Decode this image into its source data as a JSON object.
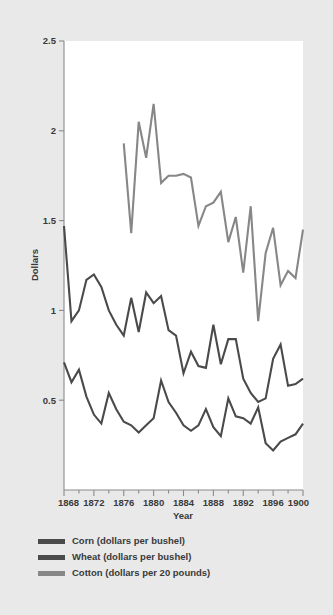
{
  "chart_data": {
    "type": "line",
    "title": "",
    "xlabel": "Year",
    "ylabel": "Dollars",
    "xlim": [
      1868,
      1900
    ],
    "ylim": [
      0,
      2.5
    ],
    "grid": false,
    "legend_position": "bottom-left",
    "x_tick_labels": [
      "1868",
      "1872",
      "1876",
      "1880",
      "1884",
      "1888",
      "1892",
      "1896",
      "1900"
    ],
    "x_tick_values": [
      1868,
      1872,
      1876,
      1880,
      1884,
      1888,
      1892,
      1896,
      1900
    ],
    "x_minor_ticks": [
      1870,
      1874,
      1878,
      1882,
      1886,
      1890,
      1894,
      1898
    ],
    "y_tick_labels": [
      "0.5",
      "1",
      "1.5",
      "2",
      "2.5"
    ],
    "y_tick_values": [
      0.5,
      1,
      1.5,
      2,
      2.5
    ],
    "colors": {
      "corn": "#4a4a4a",
      "wheat": "#4a4a4a",
      "cotton": "#878787",
      "axis": "#8a8a8a",
      "text": "#3a3a3a",
      "page_background": "#e9e9e9",
      "plot_background": "#ffffff"
    },
    "series": [
      {
        "name": "Corn (dollars per bushel)",
        "color": "#4a4a4a",
        "x": [
          1868,
          1869,
          1870,
          1871,
          1872,
          1873,
          1874,
          1875,
          1876,
          1877,
          1878,
          1879,
          1880,
          1881,
          1882,
          1883,
          1884,
          1885,
          1886,
          1887,
          1888,
          1889,
          1890,
          1891,
          1892,
          1893,
          1894,
          1895,
          1896,
          1897,
          1898,
          1899,
          1900
        ],
        "values": [
          0.71,
          0.6,
          0.67,
          0.52,
          0.42,
          0.37,
          0.54,
          0.45,
          0.38,
          0.36,
          0.32,
          0.36,
          0.4,
          0.61,
          0.49,
          0.43,
          0.36,
          0.33,
          0.36,
          0.45,
          0.35,
          0.3,
          0.51,
          0.41,
          0.4,
          0.37,
          0.46,
          0.26,
          0.22,
          0.27,
          0.29,
          0.31,
          0.37
        ]
      },
      {
        "name": "Wheat (dollars per bushel)",
        "color": "#4a4a4a",
        "x": [
          1868,
          1869,
          1870,
          1871,
          1872,
          1873,
          1874,
          1875,
          1876,
          1877,
          1878,
          1879,
          1880,
          1881,
          1882,
          1883,
          1884,
          1885,
          1886,
          1887,
          1888,
          1889,
          1890,
          1891,
          1892,
          1893,
          1894,
          1895,
          1896,
          1897,
          1898,
          1899,
          1900
        ],
        "values": [
          1.47,
          0.94,
          1.0,
          1.17,
          1.2,
          1.13,
          1.0,
          0.92,
          0.86,
          1.07,
          0.88,
          1.1,
          1.04,
          1.08,
          0.89,
          0.86,
          0.65,
          0.77,
          0.69,
          0.68,
          0.92,
          0.7,
          0.84,
          0.84,
          0.62,
          0.54,
          0.49,
          0.51,
          0.73,
          0.81,
          0.58,
          0.59,
          0.62
        ]
      },
      {
        "name": "Cotton (dollars per 20 pounds)",
        "color": "#878787",
        "x": [
          1876,
          1877,
          1878,
          1879,
          1880,
          1881,
          1882,
          1883,
          1884,
          1885,
          1886,
          1887,
          1888,
          1889,
          1890,
          1891,
          1892,
          1893,
          1894,
          1895,
          1896,
          1897,
          1898,
          1899,
          1900
        ],
        "values": [
          1.93,
          1.43,
          2.05,
          1.85,
          2.15,
          1.71,
          1.75,
          1.75,
          1.76,
          1.74,
          1.47,
          1.58,
          1.6,
          1.66,
          1.38,
          1.52,
          1.21,
          1.58,
          0.94,
          1.32,
          1.46,
          1.14,
          1.22,
          1.18,
          1.45
        ]
      }
    ]
  },
  "legend": {
    "items": [
      {
        "label": "Corn (dollars per bushel)",
        "color": "#4a4a4a"
      },
      {
        "label": "Wheat (dollars per bushel)",
        "color": "#4a4a4a"
      },
      {
        "label": "Cotton (dollars per 20 pounds)",
        "color": "#878787"
      }
    ]
  }
}
